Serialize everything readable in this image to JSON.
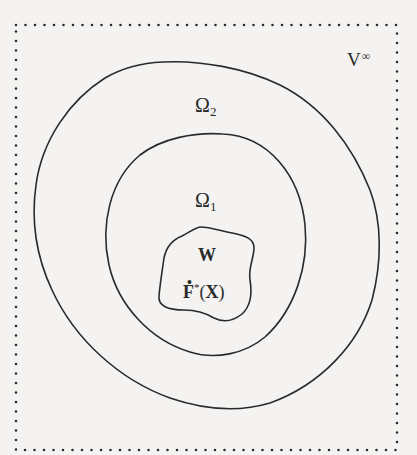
{
  "figure": {
    "type": "nested-regions-diagram",
    "colors": {
      "background": "#f4f3f1",
      "stroke": "#2a2a2a",
      "dots": "#2a2a2a"
    },
    "frame": {
      "style": "dotted",
      "label": "V",
      "label_superscript": "∞"
    },
    "regions": [
      {
        "id": "omega2",
        "label": "Ω",
        "subscript": "2",
        "shape": "tilted-ellipse"
      },
      {
        "id": "omega1",
        "label": "Ω",
        "subscript": "1",
        "shape": "ellipse"
      },
      {
        "id": "w",
        "label": "W",
        "shape": "irregular-blob"
      }
    ],
    "inner_label": {
      "letter": "F",
      "dot": "•",
      "superscript": "*",
      "open_paren": "(",
      "argument": "X",
      "close_paren": ")"
    }
  }
}
